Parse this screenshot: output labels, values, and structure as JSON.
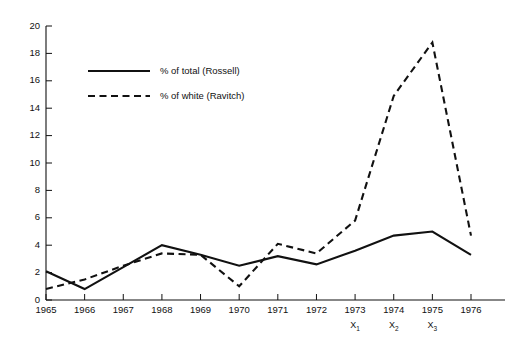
{
  "chart_data": {
    "type": "line",
    "title": "",
    "xlabel": "",
    "ylabel": "",
    "grid": false,
    "legend_position": "inside-upper-left",
    "ylim": [
      0,
      20
    ],
    "yticks": [
      0,
      2,
      4,
      6,
      8,
      10,
      12,
      14,
      16,
      18,
      20
    ],
    "ytick_labels": [
      "0",
      "2",
      "4",
      "6",
      "8",
      "10",
      "12",
      "14",
      "16",
      "18",
      "20"
    ],
    "categories": [
      "1965",
      "1966",
      "1967",
      "1968",
      "1969",
      "1970",
      "1971",
      "1972",
      "1973",
      "1974",
      "1975",
      "1976"
    ],
    "x": [
      1965,
      1966,
      1967,
      1968,
      1969,
      1970,
      1971,
      1972,
      1973,
      1974,
      1975,
      1976
    ],
    "xtick_sublabels": [
      {
        "category": "1973",
        "label": "X",
        "subscript": "1"
      },
      {
        "category": "1974",
        "label": "X",
        "subscript": "2"
      },
      {
        "category": "1975",
        "label": "X",
        "subscript": "3"
      }
    ],
    "series": [
      {
        "name": "% of total (Rossell)",
        "style": "solid",
        "color": "#111111",
        "values": [
          2.1,
          0.8,
          2.4,
          4.0,
          3.3,
          2.5,
          3.2,
          2.6,
          3.6,
          4.7,
          5.0,
          3.3
        ]
      },
      {
        "name": "% of white (Ravitch)",
        "style": "dashed",
        "color": "#111111",
        "values": [
          0.8,
          1.5,
          2.5,
          3.4,
          3.3,
          1.0,
          4.1,
          3.4,
          5.8,
          14.9,
          18.8,
          4.7
        ]
      }
    ]
  },
  "legend": {
    "entries": [
      {
        "label": "% of total (Rossell)",
        "style": "solid"
      },
      {
        "label": "% of white (Ravitch)",
        "style": "dashed"
      }
    ]
  },
  "footnote": {
    "text": ""
  }
}
